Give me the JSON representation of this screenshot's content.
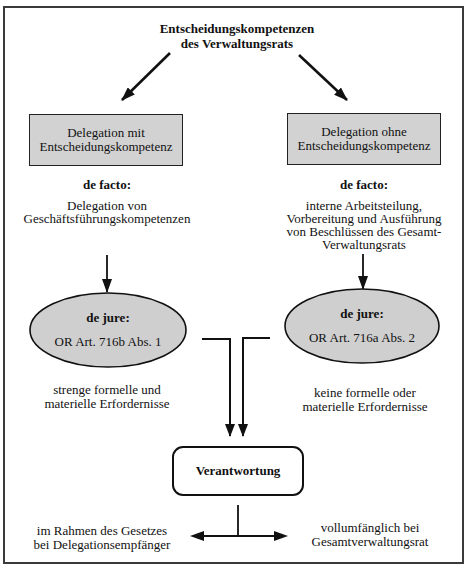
{
  "diagram": {
    "title": {
      "line1": "Entscheidungskompetenzen",
      "line2": "des Verwaltungsrats"
    },
    "left": {
      "box": {
        "line1": "Delegation mit",
        "line2": "Entscheidungskompetenz"
      },
      "de_facto_label": "de facto:",
      "de_facto_text": [
        "Delegation von",
        "Geschäftsführungskompetenzen"
      ],
      "de_jure": {
        "label": "de jure:",
        "article": "OR Art. 716b Abs. 1"
      },
      "requirements": [
        "strenge formelle und",
        "materielle Erfordernisse"
      ],
      "responsibility": [
        "im Rahmen des Gesetzes",
        "bei Delegationsempfänger"
      ]
    },
    "right": {
      "box": {
        "line1": "Delegation ohne",
        "line2": "Entscheidungskompetenz"
      },
      "de_facto_label": "de facto:",
      "de_facto_text": [
        "interne Arbeitsteilung,",
        "Vorbereitung und Ausführung",
        "von Beschlüssen des Gesamt-",
        "Verwaltungsrats"
      ],
      "de_jure": {
        "label": "de jure:",
        "article": "OR Art. 716a Abs. 2"
      },
      "requirements": [
        "keine formelle oder",
        "materielle Erfordernisse"
      ],
      "responsibility": [
        "vollumfänglich bei",
        "Gesamtverwaltungsrat"
      ]
    },
    "center": {
      "responsibility_box": "Verantwortung"
    },
    "colors": {
      "box_fill": "#d2d2d2",
      "ellipse_fill": "#cfcfcf",
      "stroke": "#111111"
    }
  }
}
